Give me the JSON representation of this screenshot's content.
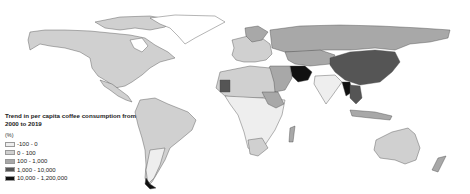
{
  "map": {
    "type": "choropleth",
    "region": "World",
    "legend": {
      "title": "Trend in per capita coffee consumption from 2000 to 2019",
      "unit": "(%)",
      "classes": [
        {
          "label": "-100 - 0",
          "color": "#eeeeee"
        },
        {
          "label": "0 - 100",
          "color": "#d0d0d0"
        },
        {
          "label": "100 - 1,000",
          "color": "#a8a8a8"
        },
        {
          "label": "1,000 - 10,000",
          "color": "#555555"
        },
        {
          "label": "10,000 - 1,200,000",
          "color": "#111111"
        }
      ]
    }
  }
}
